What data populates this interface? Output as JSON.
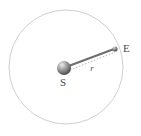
{
  "figure": {
    "type": "orbit-diagram",
    "title": "",
    "background_color": "#ffffff"
  },
  "orbit": {
    "name": "orbit-circle",
    "shape": "circle",
    "center_x": 66,
    "center_y": 67,
    "radius": 57,
    "stroke_color": "#c9c9c9",
    "stroke_width": 0.9,
    "fill": "none"
  },
  "bodies": [
    {
      "id": "sun",
      "label": "S",
      "label_name": "sun-label",
      "cx": 64,
      "cy": 68,
      "r": 7,
      "base_color": "#8a8a8a",
      "highlight_color": "#e8e8e8",
      "shadow_color": "#4d4d4d",
      "label_x": 63,
      "label_y": 86
    },
    {
      "id": "earth",
      "label": "E",
      "label_name": "earth-label",
      "cx": 115,
      "cy": 49,
      "r": 2.6,
      "base_color": "#7d7d7d",
      "highlight_color": "#d8d8d8",
      "shadow_color": "#515151",
      "label_x": 123,
      "label_y": 52
    }
  ],
  "connector": {
    "name": "sun-earth-rod",
    "x1": 66,
    "y1": 67,
    "x2": 114,
    "y2": 49,
    "stroke_color": "#6e6e6e",
    "stroke_width": 2.1
  },
  "radius_line": {
    "name": "radius-dotted-line",
    "x1": 70,
    "y1": 70,
    "x2": 115,
    "y2": 52,
    "stroke_color": "#a8a8a8",
    "stroke_width": 0.8,
    "dash": "1.6 1.6"
  },
  "radius_label": {
    "name": "radius-label",
    "text": "r",
    "x": 92,
    "y": 71,
    "color": "#555555"
  },
  "legend": {
    "sun_meaning": "S",
    "earth_meaning": "E",
    "distance_symbol": "r"
  },
  "chart_data": {
    "type": "scatter",
    "title": "",
    "xlabel": "",
    "ylabel": "",
    "annotations": [
      "S",
      "E",
      "r"
    ],
    "points": [
      {
        "label": "S",
        "x": 66,
        "y": 67
      },
      {
        "label": "E",
        "x": 115,
        "y": 49
      }
    ]
  }
}
